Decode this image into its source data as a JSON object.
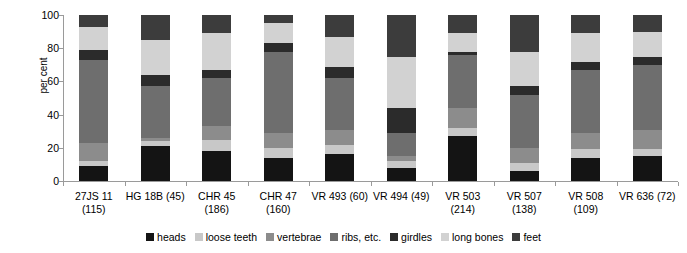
{
  "chart_data": {
    "type": "bar",
    "subtype": "stacked-100-percent",
    "title": "",
    "xlabel": "",
    "ylabel": "per cent",
    "ylim": [
      0,
      100
    ],
    "yticks": [
      0,
      20,
      40,
      60,
      80,
      100
    ],
    "grid": false,
    "legend_position": "bottom",
    "categories": [
      "27JS 11 (115)",
      "HG 18B (45)",
      "CHR 45 (186)",
      "CHR 47 (160)",
      "VR 493 (60)",
      "VR 494 (49)",
      "VR 503 (214)",
      "VR 507 (138)",
      "VR 508 (109)",
      "VR 636 (72)"
    ],
    "category_labels": [
      [
        "27JS 11",
        "(115)"
      ],
      [
        "HG 18B (45)",
        ""
      ],
      [
        "CHR 45",
        "(186)"
      ],
      [
        "CHR 47",
        "(160)"
      ],
      [
        "VR 493 (60)",
        ""
      ],
      [
        "VR 494 (49)",
        ""
      ],
      [
        "VR 503",
        "(214)"
      ],
      [
        "VR 507",
        "(138)"
      ],
      [
        "VR 508",
        "(109)"
      ],
      [
        "VR 636 (72)",
        ""
      ]
    ],
    "series": [
      {
        "name": "heads",
        "color": "#141414",
        "values": [
          9,
          21,
          18,
          14,
          16,
          8,
          27,
          6,
          14,
          15
        ]
      },
      {
        "name": "loose teeth",
        "color": "#c8c8c8",
        "values": [
          3,
          3,
          7,
          6,
          6,
          4,
          5,
          5,
          5,
          4
        ]
      },
      {
        "name": "vertebrae",
        "color": "#8c8c8c",
        "values": [
          11,
          2,
          8,
          9,
          9,
          3,
          12,
          9,
          10,
          12
        ]
      },
      {
        "name": "ribs, etc.",
        "color": "#6e6e6e",
        "values": [
          50,
          31,
          29,
          49,
          31,
          14,
          32,
          32,
          38,
          39
        ]
      },
      {
        "name": "girdles",
        "color": "#2b2b2b",
        "values": [
          6,
          7,
          5,
          5,
          7,
          15,
          2,
          5,
          5,
          5
        ]
      },
      {
        "name": "long bones",
        "color": "#d2d2d2",
        "values": [
          14,
          21,
          22,
          12,
          18,
          31,
          11,
          21,
          17,
          15
        ]
      },
      {
        "name": "feet",
        "color": "#3c3c3c",
        "values": [
          7,
          15,
          11,
          5,
          13,
          25,
          11,
          22,
          11,
          10
        ]
      }
    ]
  },
  "legend": {
    "items": [
      {
        "label": "heads",
        "color": "#141414"
      },
      {
        "label": "loose teeth",
        "color": "#c8c8c8"
      },
      {
        "label": "vertebrae",
        "color": "#8c8c8c"
      },
      {
        "label": "ribs, etc.",
        "color": "#6e6e6e"
      },
      {
        "label": "girdles",
        "color": "#2b2b2b"
      },
      {
        "label": "long bones",
        "color": "#d2d2d2"
      },
      {
        "label": "feet",
        "color": "#3c3c3c"
      }
    ]
  },
  "axis": {
    "y_title": "per cent",
    "y_ticks": [
      "0",
      "20",
      "40",
      "60",
      "80",
      "100"
    ]
  }
}
